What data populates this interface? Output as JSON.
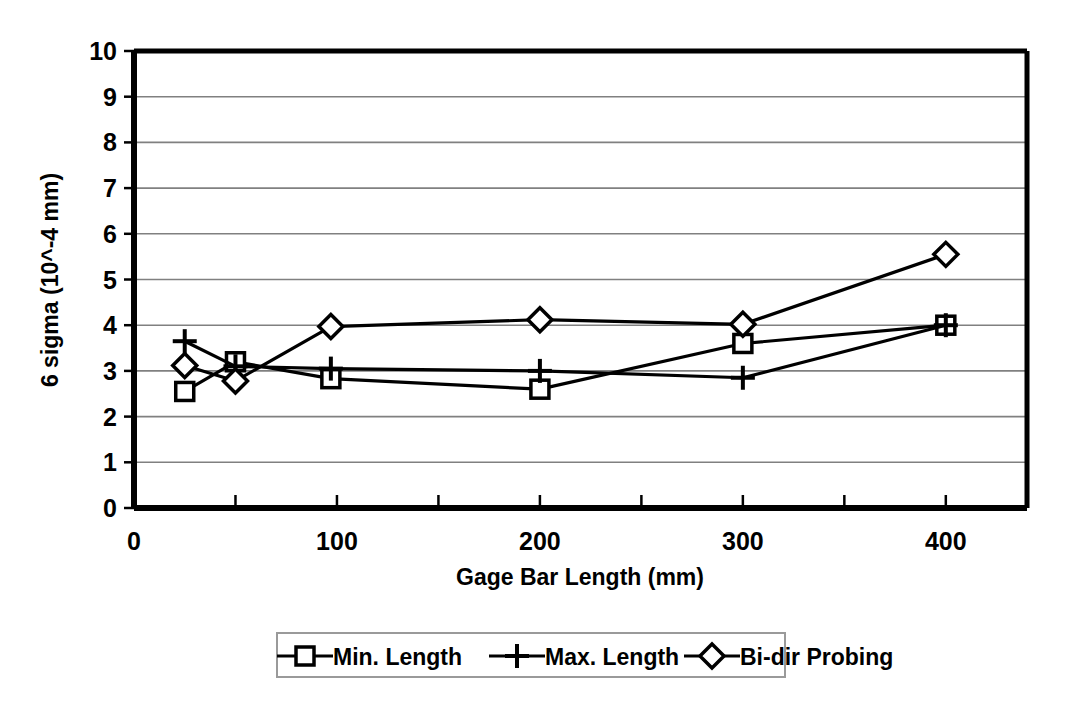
{
  "chart_data": {
    "type": "line",
    "title": "",
    "xlabel": "Gage Bar Length (mm)",
    "ylabel": "6 sigma (10^-4 mm)",
    "xlim": [
      0,
      440
    ],
    "ylim": [
      0,
      10
    ],
    "xticks": [
      0,
      100,
      200,
      300,
      400
    ],
    "xtick_labels": [
      "0",
      "100",
      "200",
      "300",
      "400"
    ],
    "xminor_step": 50,
    "yticks": [
      0,
      1,
      2,
      3,
      4,
      5,
      6,
      7,
      8,
      9,
      10
    ],
    "ytick_labels": [
      "0",
      "1",
      "2",
      "3",
      "4",
      "5",
      "6",
      "7",
      "8",
      "9",
      "10"
    ],
    "grid": "horizontal",
    "legend_position": "bottom",
    "x": [
      25,
      50,
      97,
      200,
      300,
      400
    ],
    "series": [
      {
        "name": "Min. Length",
        "marker": "square",
        "values": [
          2.55,
          3.2,
          2.83,
          2.6,
          3.6,
          4.0
        ]
      },
      {
        "name": "Max. Length",
        "marker": "plus",
        "values": [
          3.65,
          3.1,
          3.05,
          3.0,
          2.85,
          4.0
        ]
      },
      {
        "name": "Bi-dir Probing",
        "marker": "diamond",
        "values": [
          3.12,
          2.78,
          3.97,
          4.12,
          4.02,
          5.55
        ]
      }
    ],
    "line_color": "#000000",
    "grid_color": "#808080",
    "axis_color": "#000000",
    "background_color": "#ffffff"
  },
  "legend": {
    "entries": [
      {
        "label": "Min. Length"
      },
      {
        "label": "Max. Length"
      },
      {
        "label": "Bi-dir Probing"
      }
    ]
  }
}
